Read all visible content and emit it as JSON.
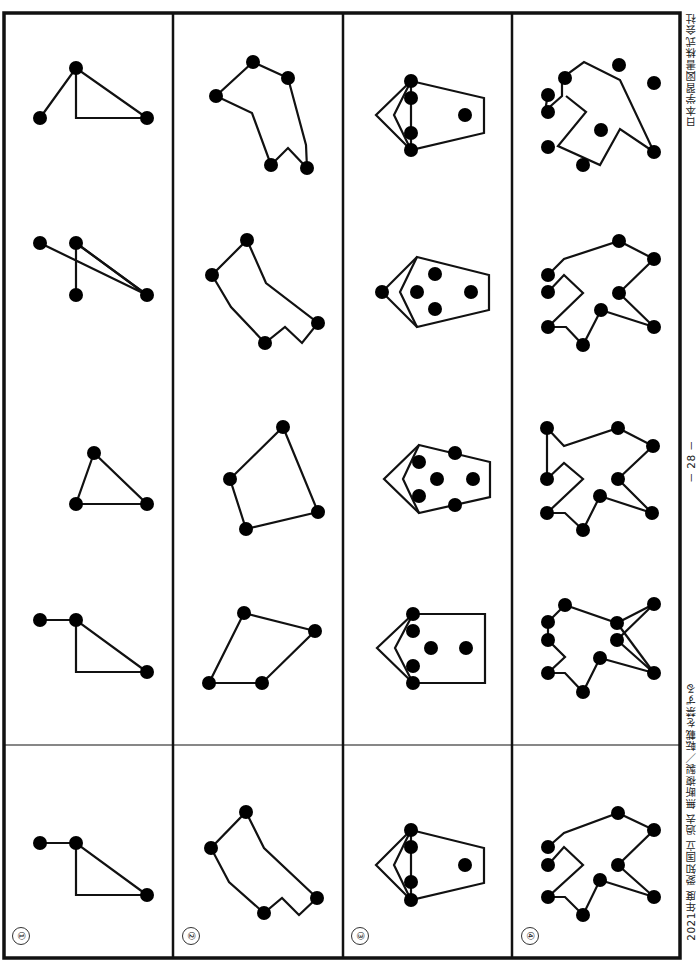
{
  "document": {
    "orientation": "rotated-90",
    "margin": {
      "publisher": "日本学習図書株式会社",
      "page_number": "－ 28 －",
      "copyright": "2021年度 愛知国立 過去 無断複製／転載を禁ずる"
    },
    "rows": [
      {
        "label": "①",
        "answer_figure": "triangle-with-tail",
        "choices": 4
      },
      {
        "label": "②",
        "answer_figure": "notched-polygon",
        "choices": 4
      },
      {
        "label": "③",
        "answer_figure": "pentagon-with-dots",
        "choices": 4
      },
      {
        "label": "④",
        "answer_figure": "star-like-polygon",
        "choices": 4
      }
    ]
  },
  "colors": {
    "line": "#111111",
    "dot": "#000000",
    "background": "#ffffff"
  }
}
